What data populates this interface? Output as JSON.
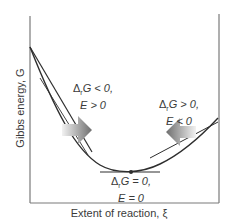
{
  "figure": {
    "y_axis_label": "Gibbs energy, G",
    "x_axis_label": "Extent of reaction, ξ",
    "annotations": {
      "left": {
        "line1": "Δ",
        "line1_sub": "r",
        "line1_rest": "G < 0,",
        "line2": "E > 0"
      },
      "right": {
        "line1": "Δ",
        "line1_sub": "r",
        "line1_rest": "G > 0,",
        "line2": "E < 0"
      },
      "bottom": {
        "line1": "Δ",
        "line1_sub": "r",
        "line1_rest": "G = 0,",
        "line2": "E = 0"
      }
    },
    "colors": {
      "axis": "#7a7a7a",
      "curve": "#2e2e2e",
      "arrow_dark": "#6e6e6e",
      "arrow_light": "#f2f2f2",
      "text": "#3a3a3a"
    }
  }
}
